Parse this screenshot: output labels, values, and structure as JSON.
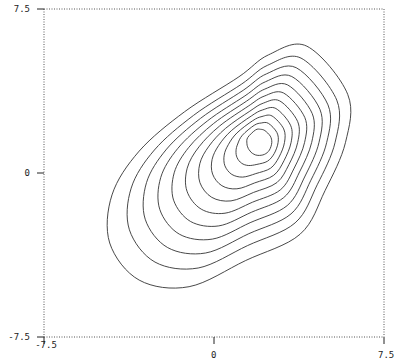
{
  "chart_data": {
    "type": "contour",
    "title": "",
    "xlabel": "",
    "ylabel": "",
    "xlim": [
      -7.5,
      7.5
    ],
    "ylim": [
      -7.5,
      7.5
    ],
    "grid": false,
    "legend": null,
    "x_ticks": [
      {
        "value": -7.5,
        "label": "-7.5"
      },
      {
        "value": 0,
        "label": "0"
      },
      {
        "value": 7.5,
        "label": "7.5"
      }
    ],
    "y_ticks": [
      {
        "value": -7.5,
        "label": "-7.5"
      },
      {
        "value": 0,
        "label": "0"
      },
      {
        "value": 7.5,
        "label": "7.5"
      }
    ],
    "contour_levels": 11,
    "density_peak": {
      "x": 2.0,
      "y": 1.4
    },
    "outer_contour_approx": [
      [
        4.1,
        5.8
      ],
      [
        5.9,
        3.6
      ],
      [
        5.8,
        1.4
      ],
      [
        4.9,
        -0.8
      ],
      [
        3.8,
        -2.8
      ],
      [
        1.4,
        -4.0
      ],
      [
        -1.1,
        -5.2
      ],
      [
        -3.3,
        -4.9
      ],
      [
        -4.6,
        -3.2
      ],
      [
        -4.5,
        -1.0
      ],
      [
        -3.3,
        1.0
      ],
      [
        -1.3,
        2.8
      ],
      [
        1.1,
        4.4
      ],
      [
        2.4,
        5.4
      ]
    ],
    "inner_contour": {
      "cx": 2.0,
      "cy": 1.4,
      "rx": 0.55,
      "ry": 0.6
    }
  },
  "axes": {
    "x_tick_labels": [
      "-7.5",
      "0",
      "7.5"
    ],
    "y_tick_labels": [
      "-7.5",
      "0",
      "7.5"
    ]
  },
  "style": {
    "line_color": "#333333",
    "frame_color": "#555555"
  }
}
